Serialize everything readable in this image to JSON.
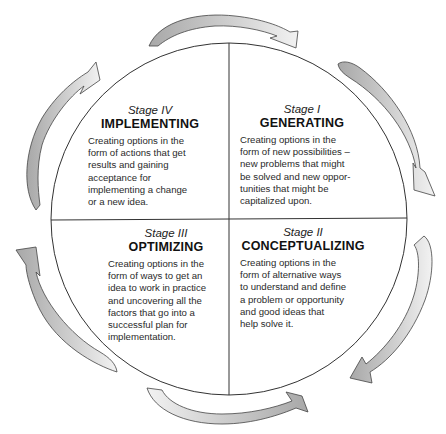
{
  "diagram": {
    "type": "cycle",
    "colors": {
      "outline": "#333333",
      "arrow_dark": "#a8a8a8",
      "arrow_light": "#ececec",
      "background": "#ffffff"
    },
    "quadrants": {
      "top_left": {
        "stage": "Stage IV",
        "title": "IMPLEMENTING",
        "lines": [
          "Creating options in the",
          "form of actions that get",
          "results and gaining",
          "acceptance for",
          "implementing a change",
          "or a new idea."
        ]
      },
      "top_right": {
        "stage": "Stage I",
        "title": "GENERATING",
        "lines": [
          "Creating options in the",
          "form of new possibilities –",
          "new problems that might",
          "be solved and new oppor-",
          "tunities that might be",
          "capitalized upon."
        ]
      },
      "bottom_left": {
        "stage": "Stage III",
        "title": "OPTIMIZING",
        "lines": [
          "Creating options in the",
          "form of ways to get an",
          "idea to work in practice",
          "and uncovering all the",
          "factors that go into a",
          "successful plan for",
          "implementation."
        ]
      },
      "bottom_right": {
        "stage": "Stage II",
        "title": "CONCEPTUALIZING",
        "lines": [
          "Creating options in the",
          "form of alternative ways",
          "to understand and define",
          "a problem or opportunity",
          "and good ideas that",
          "help solve it."
        ]
      }
    },
    "flow_direction": "clockwise",
    "arrows": [
      {
        "position": "top",
        "direction": "clockwise"
      },
      {
        "position": "upper-right",
        "direction": "clockwise"
      },
      {
        "position": "lower-right",
        "direction": "clockwise"
      },
      {
        "position": "bottom",
        "direction": "clockwise"
      },
      {
        "position": "lower-left",
        "direction": "clockwise"
      },
      {
        "position": "upper-left",
        "direction": "clockwise"
      }
    ]
  }
}
